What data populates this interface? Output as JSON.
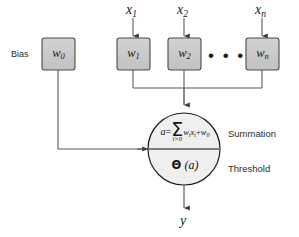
{
  "diagram": {
    "background_color": "#ffffff",
    "box_fill_color": "#c9c9c9",
    "box_border_color": "#4a4a4a",
    "circle_fill_color": "#efefef",
    "circle_border_color": "#1c1c1c",
    "line_color": "#5a5a5a",
    "text_color": "#1a1a1a"
  },
  "inputs": [
    {
      "label": "x",
      "subscript": "1"
    },
    {
      "label": "x",
      "subscript": "2"
    },
    {
      "label": "x",
      "subscript": "n"
    }
  ],
  "bias": {
    "caption": "Bias",
    "weight_label": "w",
    "weight_subscript": "0"
  },
  "weights": [
    {
      "label": "w",
      "subscript": "1"
    },
    {
      "label": "w",
      "subscript": "2"
    },
    {
      "label": "w",
      "subscript": "n"
    }
  ],
  "ellipsis": "• • •",
  "node": {
    "summation": {
      "side_label": "Summation",
      "equation_lhs": "a",
      "equation_equals": "=",
      "sum_symbol": "Σ",
      "sum_limit": "i>0",
      "term_w": "w",
      "term_w_sub": "i",
      "term_x": "x",
      "term_x_sub": "i",
      "plus": "+",
      "bias_term": "w",
      "bias_term_sub": "0",
      "equation_plain": "a = Σ(i>0) wᵢ xᵢ + w₀"
    },
    "threshold": {
      "side_label": "Threshold",
      "function_symbol": "Θ",
      "argument": "(a)",
      "expression_plain": "Θ (a)"
    }
  },
  "output": {
    "label": "y"
  }
}
